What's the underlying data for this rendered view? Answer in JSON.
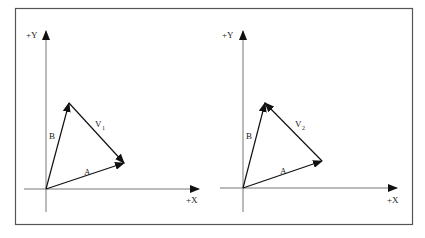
{
  "figure": {
    "frame": {
      "x": 15,
      "y": 8,
      "width": 397,
      "height": 216,
      "color": "#555555"
    },
    "panels": [
      {
        "id": "left",
        "axis_labels": {
          "y": "+Y",
          "x": "+X"
        },
        "origin": [
          46,
          189
        ],
        "vectors": [
          {
            "name": "A",
            "from": [
              46,
              189
            ],
            "to": [
              124,
              163
            ]
          },
          {
            "name": "B",
            "from": [
              46,
              189
            ],
            "to": [
              69,
              103
            ]
          },
          {
            "name": "V",
            "subscript": "1",
            "from": [
              69,
              103
            ],
            "to": [
              124,
              163
            ]
          }
        ]
      },
      {
        "id": "right",
        "axis_labels": {
          "y": "+Y",
          "x": "+X"
        },
        "origin": [
          243,
          188
        ],
        "vectors": [
          {
            "name": "A",
            "from": [
              243,
              188
            ],
            "to": [
              322,
              161
            ]
          },
          {
            "name": "B",
            "from": [
              243,
              188
            ],
            "to": [
              265,
              103
            ]
          },
          {
            "name": "V",
            "subscript": "2",
            "from": [
              322,
              161
            ],
            "to": [
              265,
              103
            ]
          }
        ]
      }
    ]
  }
}
